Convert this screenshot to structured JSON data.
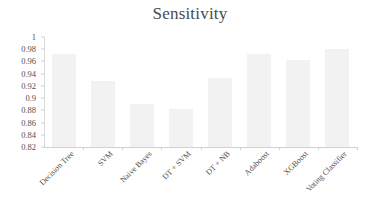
{
  "chart_data": {
    "type": "bar",
    "title": "Sensitivity",
    "xlabel": "",
    "ylabel": "",
    "ylim": [
      0.82,
      1
    ],
    "grid": false,
    "legend": "none",
    "ytick_labels": [
      "1",
      "0.98",
      "0.96",
      "0.94",
      "0.92",
      "0.9",
      "0.88",
      "0.86",
      "0.84",
      "0.82"
    ],
    "ytick_values": [
      1,
      0.98,
      0.96,
      0.94,
      0.92,
      0.9,
      0.88,
      0.86,
      0.84,
      0.82
    ],
    "categories": [
      "Decision Tree",
      "SVM",
      "Naive Bayes",
      "DT + SVM",
      "DT + NB",
      "Adaboost",
      "XGBoost",
      "Voting Classifier"
    ],
    "values": [
      0.972,
      0.928,
      0.89,
      0.883,
      0.933,
      0.972,
      0.963,
      0.981
    ],
    "bar_color": "#f2f2f2",
    "axis_color": "#d0d0d0",
    "text_color": "#4f4f4f"
  }
}
